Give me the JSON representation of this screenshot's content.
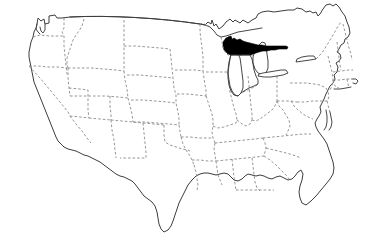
{
  "figure": {
    "kind": "locator-map",
    "title": "",
    "caption": "",
    "background_color": "#ffffff",
    "width": 367,
    "height": 246
  },
  "map": {
    "name": "contiguous-united-states",
    "projection_note": "",
    "colors": {
      "background": "#ffffff",
      "land_fill": "#ffffff",
      "national_outline": "#3d3d3d",
      "state_border": "#8a8a8a",
      "highlight_fill": "#000000",
      "water_fill": "#ffffff"
    },
    "line_styles": {
      "national_outline": "solid",
      "state_border": "dashed",
      "northern_border": "solid"
    },
    "highlight": {
      "label": "",
      "region_name": "upper-peninsula-michigan",
      "fill": "#000000",
      "bbox": [
        222,
        36,
        289,
        56
      ]
    },
    "water_bodies": [
      {
        "name": "lake-michigan"
      },
      {
        "name": "lake-huron"
      },
      {
        "name": "lake-erie"
      },
      {
        "name": "lake-ontario"
      },
      {
        "name": "lake-superior"
      }
    ],
    "legend": {
      "visible": false,
      "entries": []
    },
    "labels_visible": false
  }
}
